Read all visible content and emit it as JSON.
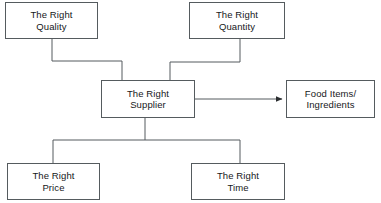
{
  "diagram": {
    "background_color": "#ffffff",
    "line_color": "#555b5e",
    "text_color": "#16181a",
    "nodes": [
      {
        "id": "quality",
        "label": "The Right\nQuality",
        "line1": "The Right",
        "line2": "Quality",
        "x": 5,
        "y": 2,
        "width": 93,
        "height": 37
      },
      {
        "id": "quantity",
        "label": "The Right\nQuantity",
        "line1": "The Right",
        "line2": "Quantity",
        "x": 189,
        "y": 2,
        "width": 96,
        "height": 37
      },
      {
        "id": "supplier",
        "label": "The Right\nSupplier",
        "line1": "The Right",
        "line2": "Supplier",
        "x": 101,
        "y": 80,
        "width": 94,
        "height": 38
      },
      {
        "id": "output",
        "label": "Food Items/\nIngredients",
        "line1": "Food Items/",
        "line2": "Ingredients",
        "x": 286,
        "y": 80,
        "width": 89,
        "height": 38
      },
      {
        "id": "price",
        "label": "The Right\nPrice",
        "line1": "The Right",
        "line2": "Price",
        "x": 7,
        "y": 163,
        "width": 93,
        "height": 37
      },
      {
        "id": "time",
        "label": "The Right\nTime",
        "line1": "The Right",
        "line2": "Time",
        "x": 191,
        "y": 163,
        "width": 94,
        "height": 37
      }
    ],
    "connectors": [
      {
        "id": "quality-to-supplier",
        "from": "quality",
        "to": "supplier",
        "arrow": false,
        "points": "52,39 52,61 122,61 122,80"
      },
      {
        "id": "quantity-to-supplier",
        "from": "quantity",
        "to": "supplier",
        "arrow": false,
        "points": "240,39 240,62 170,62 170,80"
      },
      {
        "id": "supplier-to-output",
        "from": "supplier",
        "to": "output",
        "arrow": true,
        "points": "195,99 284,99"
      },
      {
        "id": "supplier-to-bus",
        "from": "supplier",
        "to": "bottom-bus",
        "arrow": false,
        "points": "145,118 145,140"
      },
      {
        "id": "bottom-bus",
        "from": "bottom-bus",
        "to": "bottom-bus",
        "arrow": false,
        "points": "53,140 240,140"
      },
      {
        "id": "bus-to-price",
        "from": "bottom-bus",
        "to": "price",
        "arrow": false,
        "points": "53,140 53,163"
      },
      {
        "id": "bus-to-time",
        "from": "bottom-bus",
        "to": "time",
        "arrow": false,
        "points": "240,140 240,163"
      }
    ]
  }
}
